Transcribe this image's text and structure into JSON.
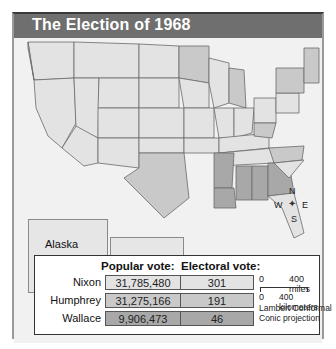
{
  "title": "The Election of 1968",
  "insets": {
    "alaska": "Alaska",
    "hawaii": "Hawaii"
  },
  "compass": {
    "n": "N",
    "s": "S",
    "e": "E",
    "w": "W"
  },
  "legend": {
    "popular_header": "Popular vote:",
    "electoral_header": "Electoral vote:",
    "rows": [
      {
        "name": "Nixon",
        "popular": "31,785,480",
        "electoral": "301",
        "color": "#e3e3e3"
      },
      {
        "name": "Humphrey",
        "popular": "31,275,166",
        "electoral": "191",
        "color": "#c9c9c9"
      },
      {
        "name": "Wallace",
        "popular": "9,906,473",
        "electoral": "46",
        "color": "#a8a8a8"
      }
    ]
  },
  "scale": {
    "miles_zero": "0",
    "miles_label": "400 miles",
    "km_zero": "0",
    "km_label": "400 kilometers",
    "projection_line1": "Lambert Conformal",
    "projection_line2": "Conic projection"
  },
  "colors": {
    "nixon": "#e3e3e3",
    "humphrey": "#c9c9c9",
    "wallace": "#a8a8a8",
    "water": "#f1f1f1",
    "title_bar": "#6f6f6f"
  }
}
